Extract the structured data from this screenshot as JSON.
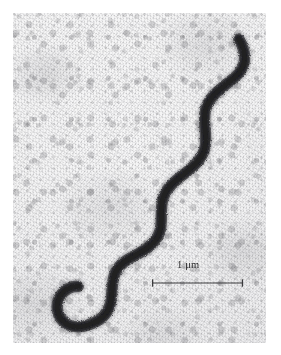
{
  "figure": {
    "kind": "transmission-electron-micrograph",
    "alt": "Electron micrograph of a helical spirochete bacterium on a mottled gray background with a 1 micrometre scale bar"
  },
  "plate": {
    "x": 13,
    "y": 13,
    "width": 253,
    "height": 330,
    "background_color": "#ededee",
    "grain_color": "#78787c",
    "page_background": "#ffffff"
  },
  "specimen": {
    "name": "spirochete-cell",
    "color": "#2b2b2d",
    "edge_color": "#4a4a4d",
    "stroke_width": 11,
    "turns": 4,
    "path": "M 150 315 C 142 305, 132 300, 122 303 C 110 307, 104 318, 106 330",
    "path_full": "M 678 78 C 690 96, 700 126, 694 150 C 686 182, 660 198, 640 214 C 612 236, 586 258, 578 292 C 570 326, 582 360, 578 394 C 574 432, 548 456, 520 478 C 492 500, 464 520, 452 552 C 440 586, 450 620, 442 652 C 434 686, 406 706, 376 722 C 346 738, 318 752, 306 782 C 294 812, 300 844, 292 874 C 284 906, 256 926, 226 936 C 196 946, 168 942, 150 924 C 130 904, 128 874, 140 852 C 152 830, 176 818, 196 820"
  },
  "scale_bar": {
    "name": "scale-bar",
    "label": "1 μm",
    "value": 1,
    "unit": "μm",
    "bar_length_px": 93,
    "tick_height_px": 9,
    "line_color": "#3a3a3c",
    "label_color": "#2a2a2c",
    "x": 138,
    "y": 246
  }
}
